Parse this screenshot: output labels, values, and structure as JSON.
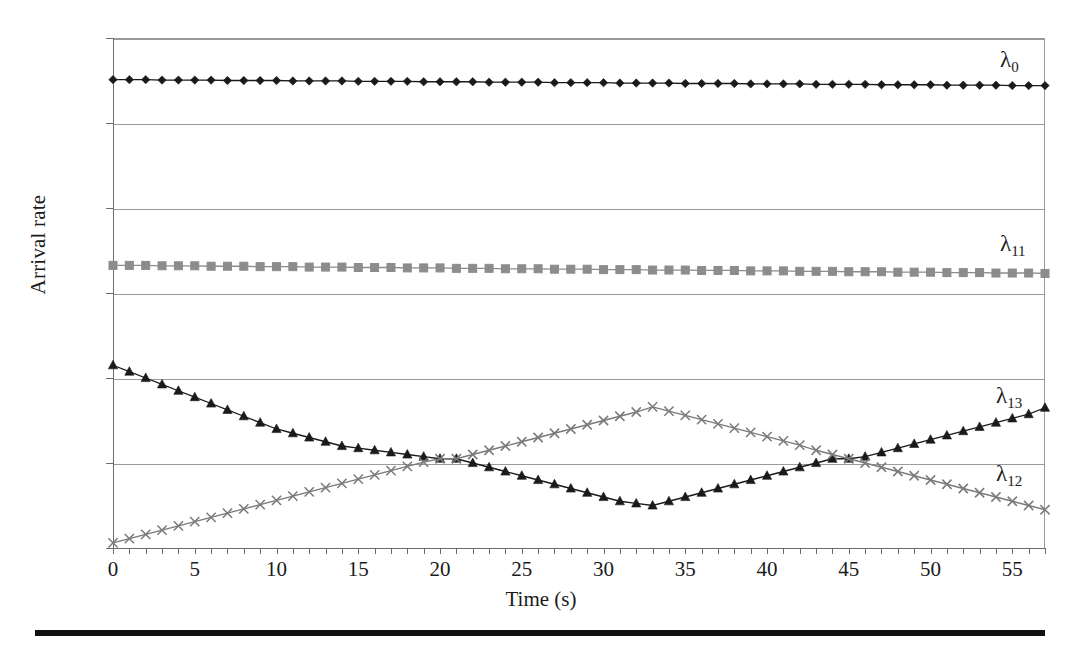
{
  "chart_data": {
    "type": "line",
    "title": "",
    "xlabel": "Time (s)",
    "ylabel": "Arrival rate",
    "xlim": [
      0,
      57
    ],
    "ylim": [
      0,
      120
    ],
    "ytick_step": 20,
    "xtick_step": 1,
    "xtick_label_step": 5,
    "grid": "horizontal",
    "legend_position": "inline-right",
    "ytick_labels": [
      "0",
      "20",
      "40",
      "60",
      "80",
      "100",
      "120"
    ],
    "ytick_values": [
      0,
      20,
      40,
      60,
      80,
      100,
      120
    ],
    "xtick_labels": [
      "0",
      "5",
      "10",
      "15",
      "20",
      "25",
      "30",
      "35",
      "40",
      "45",
      "50",
      "55"
    ],
    "xtick_values": [
      0,
      5,
      10,
      15,
      20,
      25,
      30,
      35,
      40,
      45,
      50,
      55
    ],
    "x": [
      0,
      1,
      2,
      3,
      4,
      5,
      6,
      7,
      8,
      9,
      10,
      11,
      12,
      13,
      14,
      15,
      16,
      17,
      18,
      19,
      20,
      21,
      22,
      23,
      24,
      25,
      26,
      27,
      28,
      29,
      30,
      31,
      32,
      33,
      34,
      35,
      36,
      37,
      38,
      39,
      40,
      41,
      42,
      43,
      44,
      45,
      46,
      47,
      48,
      49,
      50,
      51,
      52,
      53,
      54,
      55,
      56,
      57
    ],
    "series": [
      {
        "name": "lambda_0",
        "label": "λ",
        "sublabel": "0",
        "color": "#1a1a1a",
        "marker": "diamond",
        "label_x": 1000,
        "label_y": 48,
        "values": [
          110.2,
          110.2,
          110.2,
          110.1,
          110.1,
          110.1,
          110.1,
          110.0,
          110.0,
          110.0,
          110.0,
          109.9,
          109.9,
          109.9,
          109.9,
          109.8,
          109.8,
          109.8,
          109.8,
          109.7,
          109.7,
          109.7,
          109.7,
          109.6,
          109.6,
          109.6,
          109.6,
          109.5,
          109.5,
          109.5,
          109.5,
          109.4,
          109.4,
          109.4,
          109.4,
          109.3,
          109.3,
          109.3,
          109.3,
          109.2,
          109.2,
          109.2,
          109.2,
          109.1,
          109.1,
          109.1,
          109.1,
          109.0,
          109.0,
          109.0,
          109.0,
          108.9,
          108.9,
          108.9,
          108.9,
          108.8,
          108.8,
          108.8
        ]
      },
      {
        "name": "lambda_11",
        "label": "λ",
        "sublabel": "11",
        "color": "#8c8c8c",
        "marker": "square",
        "label_x": 1000,
        "label_y": 232,
        "values": [
          66.5,
          66.5,
          66.5,
          66.4,
          66.4,
          66.4,
          66.3,
          66.3,
          66.3,
          66.2,
          66.2,
          66.2,
          66.1,
          66.1,
          66.1,
          66.0,
          66.0,
          66.0,
          65.9,
          65.9,
          65.9,
          65.8,
          65.8,
          65.8,
          65.7,
          65.7,
          65.7,
          65.6,
          65.6,
          65.6,
          65.5,
          65.5,
          65.5,
          65.4,
          65.4,
          65.4,
          65.3,
          65.3,
          65.3,
          65.2,
          65.2,
          65.2,
          65.1,
          65.1,
          65.1,
          65.0,
          65.0,
          65.0,
          64.9,
          64.9,
          64.9,
          64.8,
          64.8,
          64.8,
          64.7,
          64.7,
          64.7,
          64.6
        ]
      },
      {
        "name": "lambda_13",
        "label": "λ",
        "sublabel": "13",
        "color": "#1a1a1a",
        "marker": "triangle",
        "label_x": 996,
        "label_y": 384,
        "values": [
          43.0,
          41.5,
          40.0,
          38.5,
          37.0,
          35.5,
          34.0,
          32.5,
          31.0,
          29.5,
          28.0,
          27.0,
          26.0,
          25.0,
          24.0,
          23.5,
          23.0,
          22.5,
          22.0,
          21.5,
          21.0,
          21.0,
          20.0,
          19.0,
          18.0,
          17.0,
          16.0,
          15.0,
          14.0,
          13.0,
          12.0,
          11.0,
          10.5,
          10.0,
          11.0,
          12.0,
          13.0,
          14.0,
          15.0,
          16.0,
          17.0,
          18.0,
          19.0,
          20.0,
          21.0,
          21.0,
          21.5,
          22.5,
          23.5,
          24.5,
          25.5,
          26.5,
          27.5,
          28.5,
          29.5,
          30.5,
          31.5,
          33.0
        ]
      },
      {
        "name": "lambda_12",
        "label": "λ",
        "sublabel": "12",
        "color": "#7a7a7a",
        "marker": "cross",
        "label_x": 996,
        "label_y": 462,
        "values": [
          1.2,
          2.2,
          3.2,
          4.2,
          5.2,
          6.2,
          7.2,
          8.2,
          9.2,
          10.2,
          11.2,
          12.2,
          13.2,
          14.2,
          15.2,
          16.2,
          17.2,
          18.2,
          19.2,
          20.2,
          21.0,
          21.0,
          22.0,
          23.0,
          24.0,
          25.0,
          26.0,
          27.0,
          28.0,
          29.0,
          30.0,
          31.0,
          32.0,
          33.2,
          32.2,
          31.2,
          30.2,
          29.2,
          28.2,
          27.2,
          26.2,
          25.2,
          24.2,
          23.0,
          22.0,
          21.0,
          20.0,
          19.0,
          18.0,
          17.0,
          16.0,
          15.0,
          14.0,
          13.0,
          12.0,
          11.0,
          10.0,
          9.0
        ]
      }
    ]
  }
}
